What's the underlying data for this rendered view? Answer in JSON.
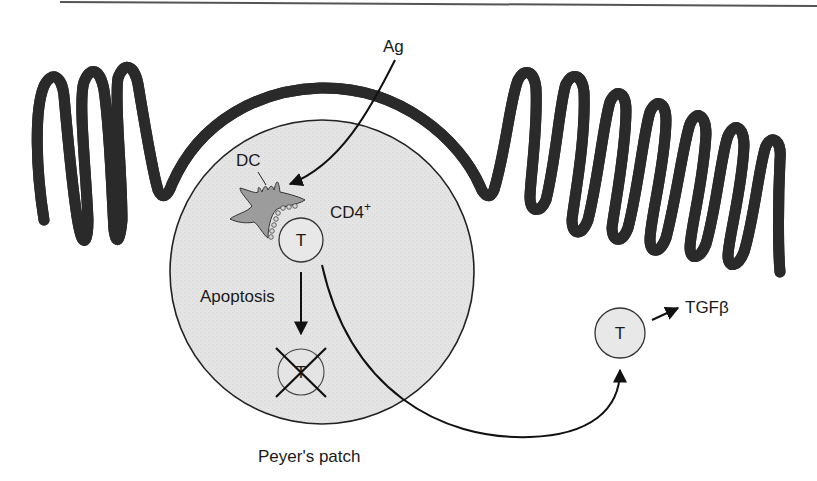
{
  "figure": {
    "type": "diagram",
    "colors": {
      "background": "#ffffff",
      "epithelium_fill": "#a9a9a9",
      "epithelium_stroke": "#333333",
      "patch_fill": "#e6e6e6",
      "dc_fill": "#9c9c9c",
      "cell_fill": "#e8e8e8",
      "line": "#111111",
      "top_rule": "#555555"
    }
  },
  "labels": {
    "antigen": "Ag",
    "dendritic_cell": "DC",
    "cd4_base": "CD4",
    "cd4_sup": "+",
    "t_cell": "T",
    "apoptosis": "Apoptosis",
    "apoptotic_t_cell": "T",
    "migrating_t_cell": "T",
    "tgf_base": "TGF",
    "tgf_greek": "β",
    "peyers_patch": "Peyer's patch"
  },
  "arrows": [
    {
      "from": "antigen",
      "to": "dendritic_cell",
      "meaning": "antigen uptake"
    },
    {
      "from": "t_cell",
      "to": "apoptotic_t_cell",
      "meaning": "apoptosis"
    },
    {
      "from": "t_cell",
      "to": "migrating_t_cell",
      "meaning": "migration out of Peyer's patch"
    },
    {
      "from": "migrating_t_cell",
      "to": "tgf",
      "meaning": "secretes TGFβ"
    }
  ]
}
